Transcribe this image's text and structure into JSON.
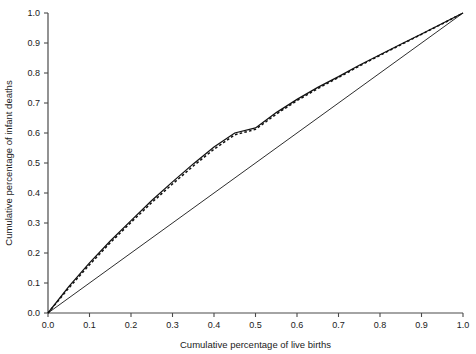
{
  "chart_data": {
    "type": "line",
    "title": "",
    "xlabel": "Cumulative percentage of live births",
    "ylabel": "Cumulative percentage of infant deaths",
    "xlim": [
      0.0,
      1.0
    ],
    "ylim": [
      0.0,
      1.0
    ],
    "grid": false,
    "legend": "none",
    "xticks": [
      "0.0",
      "0.1",
      "0.2",
      "0.3",
      "0.4",
      "0.5",
      "0.6",
      "0.7",
      "0.8",
      "0.9",
      "1.0"
    ],
    "yticks": [
      "0.0",
      "0.1",
      "0.2",
      "0.3",
      "0.4",
      "0.5",
      "0.6",
      "0.7",
      "0.8",
      "0.9",
      "1.0"
    ],
    "xtick_values": [
      0.0,
      0.1,
      0.2,
      0.3,
      0.4,
      0.5,
      0.6,
      0.7,
      0.8,
      0.9,
      1.0
    ],
    "ytick_values": [
      0.0,
      0.1,
      0.2,
      0.3,
      0.4,
      0.5,
      0.6,
      0.7,
      0.8,
      0.9,
      1.0
    ],
    "series": [
      {
        "name": "lorenz-curve-solid",
        "style": "solid",
        "color": "#111111",
        "x": [
          0.0,
          0.05,
          0.1,
          0.15,
          0.2,
          0.25,
          0.3,
          0.35,
          0.4,
          0.45,
          0.5,
          0.55,
          0.6,
          0.65,
          0.7,
          0.75,
          0.8,
          0.85,
          0.9,
          0.95,
          1.0
        ],
        "y": [
          0.0,
          0.088,
          0.167,
          0.24,
          0.308,
          0.375,
          0.437,
          0.497,
          0.553,
          0.6,
          0.617,
          0.668,
          0.712,
          0.752,
          0.788,
          0.826,
          0.861,
          0.896,
          0.93,
          0.965,
          1.0
        ]
      },
      {
        "name": "lorenz-curve-dashed",
        "style": "dashed",
        "color": "#111111",
        "x": [
          0.0,
          0.05,
          0.1,
          0.15,
          0.2,
          0.25,
          0.3,
          0.35,
          0.4,
          0.45,
          0.5,
          0.55,
          0.6,
          0.65,
          0.7,
          0.75,
          0.8,
          0.85,
          0.9,
          0.95,
          1.0
        ],
        "y": [
          0.0,
          0.083,
          0.161,
          0.234,
          0.302,
          0.368,
          0.43,
          0.49,
          0.546,
          0.594,
          0.612,
          0.663,
          0.708,
          0.748,
          0.785,
          0.823,
          0.859,
          0.894,
          0.929,
          0.964,
          1.0
        ]
      },
      {
        "name": "line-of-equality",
        "style": "solid",
        "color": "#222222",
        "x": [
          0.0,
          1.0
        ],
        "y": [
          0.0,
          1.0
        ]
      }
    ]
  }
}
